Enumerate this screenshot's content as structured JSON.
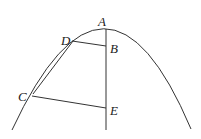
{
  "diagram": {
    "type": "parabola-geometry",
    "colors": {
      "stroke": "#333333",
      "background": "#ffffff"
    },
    "labels": {
      "A": "A",
      "B": "B",
      "C": "C",
      "D": "D",
      "E": "E"
    },
    "points": {
      "A": [
        106,
        29
      ],
      "B": [
        106,
        46
      ],
      "C": [
        32,
        96
      ],
      "D": [
        72,
        41
      ],
      "E": [
        106,
        108
      ]
    },
    "segments": [
      [
        "A",
        "axis-bottom"
      ],
      [
        "D",
        "B"
      ],
      [
        "C",
        "E"
      ],
      [
        "C",
        "D"
      ]
    ]
  }
}
